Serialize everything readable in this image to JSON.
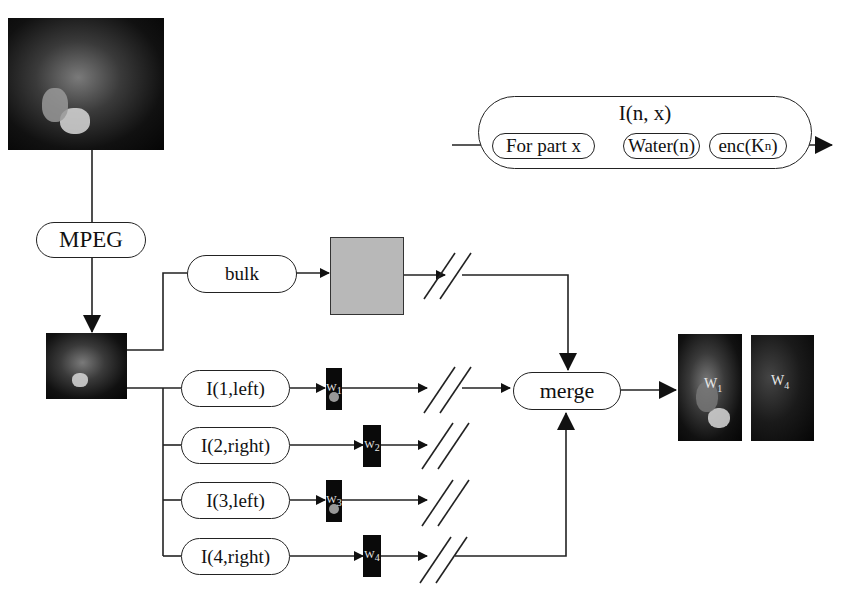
{
  "caption_fragment": "Fig. … … … … p … p …",
  "legend": {
    "outer_label": "I(n, x)",
    "steps": [
      "For part x",
      "Water(n)",
      "enc(K",
      "n",
      ")"
    ]
  },
  "nodes": {
    "mpeg": "MPEG",
    "bulk": "bulk",
    "merge": "merge",
    "branches": [
      "I(1,left)",
      "I(2,right)",
      "I(3,left)",
      "I(4,right)"
    ],
    "thumb_labels": [
      "W",
      "W",
      "W",
      "W"
    ],
    "thumb_subs": [
      "1",
      "2",
      "3",
      "4"
    ]
  },
  "output": {
    "images": [
      {
        "label": "W",
        "sub": "1"
      },
      {
        "label": "W",
        "sub": "4"
      }
    ]
  },
  "colors": {
    "line": "#222222",
    "encrypted_box": "#b8b8b8",
    "background": "#ffffff"
  }
}
